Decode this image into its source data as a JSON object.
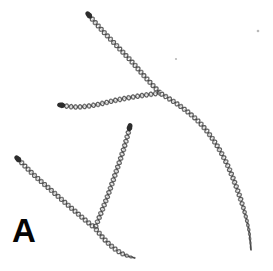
{
  "figure": {
    "panel_label": "A",
    "background_color": "#ffffff",
    "width": 273,
    "height": 271,
    "filament_color": "#6f6f6f",
    "filament_dark_color": "#3a3a3a",
    "tip_cap_color": "#2c2c2c",
    "label_color": "#050505",
    "speck_color": "#b9b9b9"
  },
  "chart_data": {
    "type": "scatter",
    "title": "A",
    "subtitle": "",
    "xlabel": "",
    "ylabel": "",
    "grid": false,
    "legend": "none",
    "xlim": [
      0,
      273
    ],
    "ylim": [
      0,
      271
    ],
    "annotations": [
      {
        "name": "panel-label",
        "text": "A",
        "x": 26,
        "y": 233
      }
    ],
    "junctions": [
      {
        "name": "upper-junction",
        "x": 160,
        "y": 93,
        "arms": 3
      },
      {
        "name": "lower-junction",
        "x": 95,
        "y": 228,
        "arms": 3
      }
    ],
    "series": [
      {
        "name": "filament-upper-left-arm",
        "style": "twisted-pair",
        "end_cap_start": "blunt",
        "end_cap_end": "junction",
        "x": [
          88,
          100,
          116,
          132,
          146,
          160
        ],
        "y": [
          14,
          28,
          45,
          62,
          78,
          93
        ]
      },
      {
        "name": "filament-left-arm",
        "style": "twisted-pair",
        "end_cap_start": "blunt",
        "end_cap_end": "junction",
        "x": [
          60,
          76,
          95,
          117,
          139,
          160
        ],
        "y": [
          105,
          107,
          105,
          100,
          96,
          93
        ]
      },
      {
        "name": "filament-long-right-curve",
        "style": "twisted-pair",
        "end_cap_start": "junction",
        "end_cap_end": "tapered",
        "x": [
          160,
          180,
          199,
          214,
          226,
          236,
          244,
          249,
          251
        ],
        "y": [
          93,
          106,
          122,
          141,
          162,
          186,
          210,
          231,
          250
        ]
      },
      {
        "name": "filament-middle-descending",
        "style": "twisted-pair",
        "end_cap_start": "blunt",
        "end_cap_end": "junction",
        "x": [
          130,
          124,
          116,
          108,
          101,
          95
        ],
        "y": [
          126,
          148,
          172,
          195,
          213,
          228
        ]
      },
      {
        "name": "filament-lower-left",
        "style": "twisted-pair",
        "end_cap_start": "blunt",
        "end_cap_end": "junction",
        "x": [
          17,
          34,
          52,
          69,
          84,
          95
        ],
        "y": [
          158,
          175,
          191,
          206,
          219,
          228
        ]
      },
      {
        "name": "filament-lower-tail",
        "style": "twisted-pair",
        "end_cap_start": "junction",
        "end_cap_end": "tapered",
        "x": [
          95,
          105,
          115,
          125,
          135
        ],
        "y": [
          228,
          240,
          249,
          255,
          258
        ]
      }
    ],
    "specks": [
      {
        "name": "background-speck-1",
        "x": 258,
        "y": 31,
        "r": 1.3
      },
      {
        "name": "background-speck-2",
        "x": 176,
        "y": 59,
        "r": 1.1
      }
    ]
  }
}
